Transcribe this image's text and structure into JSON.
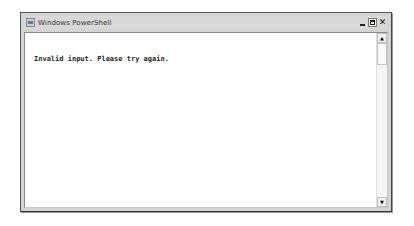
{
  "window": {
    "title": "Windows PowerShell",
    "icon": "powershell-icon",
    "controls": {
      "minimize": "minimize-icon",
      "maximize": "maximize-icon",
      "close_glyph": "✕"
    }
  },
  "console": {
    "lines": [
      "Invalid input. Please try again."
    ]
  },
  "scrollbar": {
    "up_glyph": "▲",
    "down_glyph": "▼"
  },
  "colors": {
    "frame": "#d4d4d4",
    "background": "#ffffff",
    "text": "#222222"
  }
}
